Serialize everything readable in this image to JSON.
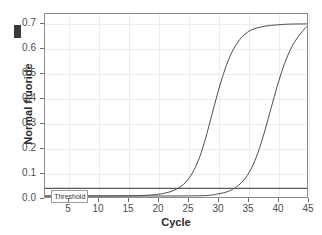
{
  "chart_data": {
    "type": "line",
    "title": "",
    "xlabel": "Cycle",
    "ylabel": "Normal fluoride",
    "xlim": [
      1,
      45
    ],
    "ylim": [
      0.0,
      0.74
    ],
    "xticks": [
      5,
      10,
      15,
      20,
      25,
      30,
      35,
      40,
      45
    ],
    "yticks": [
      "0.0",
      "0.1",
      "0.2",
      "0.3",
      "0.4",
      "0.5",
      "0.6",
      "0.7"
    ],
    "ytick_values": [
      0.0,
      0.1,
      0.2,
      0.3,
      0.4,
      0.5,
      0.6,
      0.7
    ],
    "grid": true,
    "legend": "none",
    "annotations": [
      {
        "name": "threshold",
        "label": "Threshold",
        "y": 0.035,
        "type": "hline",
        "label_x": 2.2
      }
    ],
    "series": [
      {
        "name": "curve-1",
        "color": "#4a4a4a",
        "plateau": 0.7,
        "baseline": 0.004,
        "inflection_cycle": 28.0,
        "threshold_crossing_cycle": 23.5,
        "x": [
          1,
          5,
          10,
          15,
          18,
          20,
          21,
          22,
          23,
          24,
          25,
          26,
          27,
          28,
          29,
          30,
          31,
          32,
          33,
          34,
          35,
          36,
          38,
          40,
          42,
          45
        ],
        "y": [
          0.004,
          0.004,
          0.004,
          0.005,
          0.007,
          0.011,
          0.015,
          0.021,
          0.031,
          0.046,
          0.07,
          0.108,
          0.163,
          0.24,
          0.33,
          0.42,
          0.5,
          0.565,
          0.612,
          0.645,
          0.666,
          0.679,
          0.691,
          0.696,
          0.699,
          0.7
        ]
      },
      {
        "name": "curve-2",
        "color": "#4a4a4a",
        "plateau": 0.7,
        "baseline": 0.004,
        "inflection_cycle": 37.5,
        "threshold_crossing_cycle": 32.5,
        "x": [
          1,
          10,
          20,
          27,
          29,
          30,
          31,
          32,
          33,
          34,
          35,
          36,
          37,
          38,
          39,
          40,
          41,
          42,
          43,
          44,
          45
        ],
        "y": [
          0.004,
          0.004,
          0.004,
          0.005,
          0.008,
          0.012,
          0.017,
          0.025,
          0.038,
          0.058,
          0.088,
          0.133,
          0.196,
          0.275,
          0.362,
          0.448,
          0.524,
          0.585,
          0.63,
          0.663,
          0.69
        ]
      }
    ]
  },
  "artifacts": {
    "axis_marker": "dark-rectangle-marker"
  }
}
